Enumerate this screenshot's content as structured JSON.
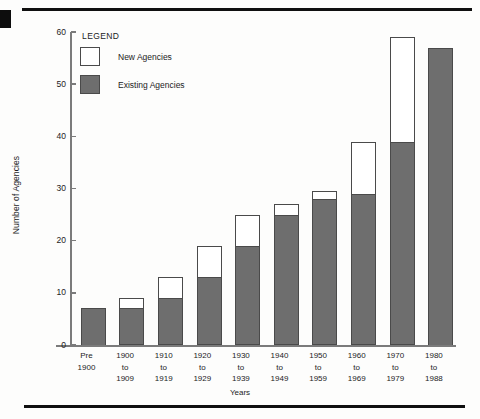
{
  "chart_data": {
    "type": "bar",
    "subtype": "stacked",
    "title": "",
    "xlabel": "Years",
    "ylabel": "Number of Agencies",
    "ylim": [
      0,
      60
    ],
    "yticks": [
      0,
      10,
      20,
      30,
      40,
      50,
      60
    ],
    "grid": false,
    "legend_position": "top-left",
    "legend_title": "LEGEND",
    "categories": [
      "Pre\n1900",
      "1900\nto\n1909",
      "1910\nto\n1919",
      "1920\nto\n1929",
      "1930\nto\n1939",
      "1940\nto\n1949",
      "1950\nto\n1959",
      "1960\nto\n1969",
      "1970\nto\n1979",
      "1980\nto\n1988"
    ],
    "category_lines": [
      [
        "Pre",
        "1900"
      ],
      [
        "1900",
        "to",
        "1909"
      ],
      [
        "1910",
        "to",
        "1919"
      ],
      [
        "1920",
        "to",
        "1929"
      ],
      [
        "1930",
        "to",
        "1939"
      ],
      [
        "1940",
        "to",
        "1949"
      ],
      [
        "1950",
        "to",
        "1959"
      ],
      [
        "1960",
        "to",
        "1969"
      ],
      [
        "1970",
        "to",
        "1979"
      ],
      [
        "1980",
        "to",
        "1988"
      ]
    ],
    "series": [
      {
        "name": "Existing Agencies",
        "color": "#6e6e6e",
        "values": [
          7,
          7,
          9,
          13,
          19,
          25,
          28,
          29,
          39,
          57
        ]
      },
      {
        "name": "New Agencies",
        "color": "#ffffff",
        "values": [
          0,
          2,
          4,
          6,
          6,
          2,
          1.5,
          10,
          20,
          0
        ]
      }
    ],
    "totals": [
      7,
      9,
      13,
      19,
      25,
      27,
      29.5,
      39,
      59,
      57
    ]
  },
  "legend": {
    "title": "LEGEND",
    "items": [
      {
        "label": "New Agencies",
        "swatch": "new"
      },
      {
        "label": "Existing Agencies",
        "swatch": "existing"
      }
    ]
  },
  "axes": {
    "y_title": "Number of Agencies",
    "x_title": "Years",
    "y_ticks": [
      "0",
      "10",
      "20",
      "30",
      "40",
      "50",
      "60"
    ]
  },
  "colors": {
    "existing": "#6e6e6e",
    "new": "#ffffff",
    "outline": "#4a4a4a",
    "axis": "#7b7b7b",
    "text": "#1c1c1c",
    "rule": "#101010"
  }
}
